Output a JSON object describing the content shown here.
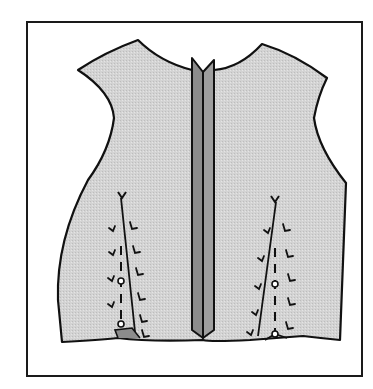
{
  "figure": {
    "caption_fragment": "",
    "colors": {
      "background": "#ffffff",
      "frame_stroke": "#1a1a1a",
      "garment_fill": "#d3d3d3",
      "garment_stroke": "#111111",
      "band_left_fill": "#8c8c8c",
      "band_right_fill": "#9e9e9e",
      "mark_stroke": "#111111"
    },
    "frame": {
      "x": 27,
      "y": 22,
      "width": 335,
      "height": 354,
      "stroke_width": 2
    },
    "garment": {
      "outline_path": "M78,70 Q105,52 138,40 Q160,62 192,70 L203,72 L214,70 Q240,68 262,44 Q295,54 327,78 Q318,96 314,118 Q318,148 346,183 L340,340 Q320,338 303,336 L250,340 Q210,342 203,340 Q150,342 118,338 Q100,340 62,342 L58,300 Q56,240 88,180 Q110,150 114,118 Q112,92 78,70 Z",
      "hem_fold_left": "M118,338 L115,330 L132,328 L140,338",
      "hem_fold_right": "M265,340 L275,334 L287,338"
    },
    "center_band": {
      "left_strip": "M192,58 L203,72 L203,338 L192,330 Z",
      "right_strip": "M203,72 L214,60 L214,330 L203,338 Z",
      "center_line": "M203,72 L203,338"
    },
    "darts": [
      {
        "name": "left-dart",
        "fold_line": "M121,198 L135,332",
        "apex_mark": "M118,192 L122,198 L126,192",
        "dashed_line": {
          "x1": 121,
          "y1": 246,
          "x2": 121,
          "y2": 325
        },
        "tacks": [
          {
            "cx": 121,
            "cy": 281,
            "r": 3
          },
          {
            "cx": 121,
            "cy": 324,
            "r": 3
          }
        ],
        "v_marks": [
          "M109,228 L113,231 L115,226",
          "M109,252 L113,255 L115,250",
          "M108,278 L112,281 L114,276",
          "M108,304 L112,307 L114,302",
          "M130,222 L132,229 L137,228",
          "M133,246 L135,253 L140,252",
          "M136,268 L138,275 L143,274",
          "M138,293 L140,300 L145,299",
          "M140,315 L142,322 L147,321",
          "M142,330 L144,337 L149,336"
        ]
      },
      {
        "name": "right-dart",
        "fold_line": "M276,202 L258,336",
        "apex_mark": "M271,196 L275,202 L279,196",
        "dashed_line": {
          "x1": 275,
          "y1": 248,
          "x2": 275,
          "y2": 332
        },
        "tacks": [
          {
            "cx": 275,
            "cy": 284,
            "r": 3
          },
          {
            "cx": 275,
            "cy": 334,
            "r": 3
          }
        ],
        "v_marks": [
          "M264,230 L268,233 L270,228",
          "M258,258 L262,261 L264,256",
          "M255,286 L259,289 L261,284",
          "M252,312 L256,315 L258,310",
          "M247,332 L251,335 L253,330",
          "M283,224 L285,231 L290,230",
          "M286,250 L288,257 L293,256",
          "M288,274 L290,281 L295,280",
          "M288,298 L290,305 L295,304",
          "M286,322 L288,329 L293,328"
        ]
      }
    ]
  }
}
